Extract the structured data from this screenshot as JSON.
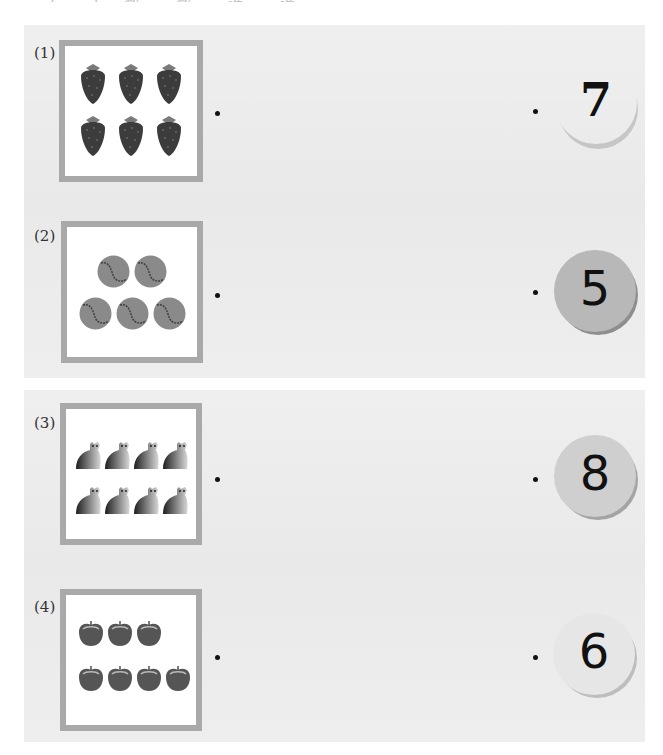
{
  "header": {
    "clipped_instruction": "(一) 数一数，连一连"
  },
  "problems": [
    {
      "label": "(1)",
      "object": "strawberry",
      "count": 6,
      "rows": [
        3,
        3
      ],
      "number": "7"
    },
    {
      "label": "(2)",
      "object": "tennis-ball",
      "count": 5,
      "rows": [
        2,
        3
      ],
      "number": "5"
    },
    {
      "label": "(3)",
      "object": "polar-bear",
      "count": 8,
      "rows": [
        4,
        4
      ],
      "number": "8"
    },
    {
      "label": "(4)",
      "object": "apple",
      "count": 7,
      "rows": [
        3,
        4
      ],
      "number": "6"
    }
  ],
  "colors": {
    "panel_bg": "#ececec",
    "frame_border": "#a9a9a9",
    "badge_dark": "#b8b8b8",
    "badge_light": "#ebebeb",
    "dot": "#111111"
  }
}
